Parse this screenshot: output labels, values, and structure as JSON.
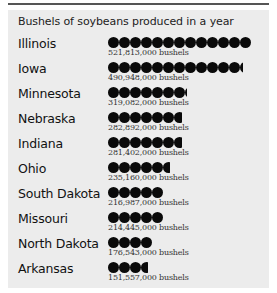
{
  "title": "Bushels of soybeans produced in a year",
  "chart_data": {
    "type": "bar",
    "subtype": "pictograph",
    "title": "Bushels of soybeans produced in a year",
    "unit": "bushels",
    "icon": "filled-circle",
    "categories": [
      "Illinois",
      "Iowa",
      "Minnesota",
      "Nebraska",
      "Indiana",
      "Ohio",
      "South Dakota",
      "Missouri",
      "North Dakota",
      "Arkansas"
    ],
    "values": [
      521813000,
      490948000,
      319082000,
      282892000,
      281402000,
      235160000,
      216987000,
      214445000,
      176543000,
      151557000
    ],
    "icon_counts": [
      13,
      12.3,
      7.2,
      6.7,
      6.7,
      5.6,
      5,
      5,
      4,
      3.6
    ],
    "xlabel": "",
    "ylabel": ""
  },
  "rows": [
    {
      "label": "Illinois",
      "value_text": "521,813,000 bushels",
      "icons": 13
    },
    {
      "label": "Iowa",
      "value_text": "490,948,000 bushels",
      "icons": 12.3
    },
    {
      "label": "Minnesota",
      "value_text": "319,082,000 bushels",
      "icons": 7.2
    },
    {
      "label": "Nebraska",
      "value_text": "282,892,000 bushels",
      "icons": 6.7
    },
    {
      "label": "Indiana",
      "value_text": "281,402,000 bushels",
      "icons": 6.7
    },
    {
      "label": "Ohio",
      "value_text": "235,160,000 bushels",
      "icons": 5.6
    },
    {
      "label": "South Dakota",
      "value_text": "216,987,000 bushels",
      "icons": 5
    },
    {
      "label": "Missouri",
      "value_text": "214,445,000 bushels",
      "icons": 5
    },
    {
      "label": "North Dakota",
      "value_text": "176,543,000 bushels",
      "icons": 4
    },
    {
      "label": "Arkansas",
      "value_text": "151,557,000 bushels",
      "icons": 3.6
    }
  ],
  "colors": {
    "panel": "#ececec",
    "icon": "#0a0a0a",
    "rule": "#555555"
  }
}
